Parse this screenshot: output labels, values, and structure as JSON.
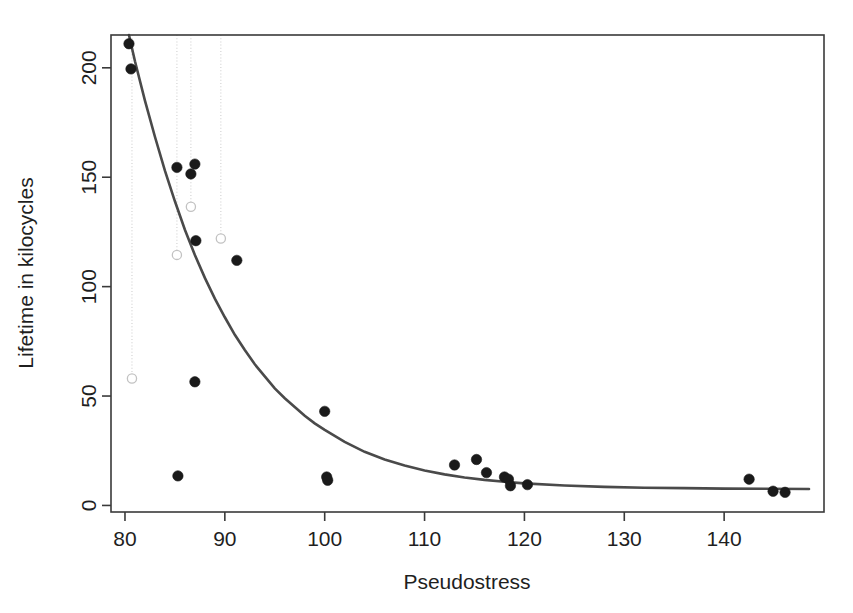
{
  "figure": {
    "background": "#ffffff",
    "foreground": "#1a1a1a",
    "curve_color": "#4a4a4a",
    "dropline_color": "#cfcfcf",
    "open_point_color": "#c2c2c2"
  },
  "axis_titles": {
    "x": "Pseudostress",
    "y": "Lifetime in kilocycles"
  },
  "chart_data": {
    "type": "scatter",
    "title": "",
    "xlabel": "Pseudostress",
    "ylabel": "Lifetime in kilocycles",
    "xlim": [
      78.6,
      150.0
    ],
    "ylim": [
      -3.0,
      215.0
    ],
    "xticks": [
      80,
      90,
      100,
      110,
      120,
      130,
      140
    ],
    "yticks": [
      0,
      50,
      100,
      150,
      200
    ],
    "xticklabels": [
      "80",
      "90",
      "100",
      "110",
      "120",
      "130",
      "140"
    ],
    "yticklabels": [
      "0",
      "50",
      "100",
      "150",
      "200"
    ],
    "grid": false,
    "legend": null,
    "series": [
      {
        "name": "observed",
        "marker": "filled-circle",
        "color": "#1a1a1a",
        "points": [
          {
            "x": 80.4,
            "y": 211.0
          },
          {
            "x": 80.6,
            "y": 199.5
          },
          {
            "x": 85.2,
            "y": 154.5
          },
          {
            "x": 86.6,
            "y": 151.5
          },
          {
            "x": 87.0,
            "y": 156.0
          },
          {
            "x": 87.1,
            "y": 121.0
          },
          {
            "x": 87.0,
            "y": 56.5
          },
          {
            "x": 85.3,
            "y": 13.5
          },
          {
            "x": 91.2,
            "y": 112.0
          },
          {
            "x": 100.0,
            "y": 43.0
          },
          {
            "x": 100.2,
            "y": 13.0
          },
          {
            "x": 100.3,
            "y": 11.5
          },
          {
            "x": 113.0,
            "y": 18.5
          },
          {
            "x": 115.2,
            "y": 21.0
          },
          {
            "x": 116.2,
            "y": 15.0
          },
          {
            "x": 118.0,
            "y": 13.0
          },
          {
            "x": 118.4,
            "y": 12.0
          },
          {
            "x": 118.6,
            "y": 9.0
          },
          {
            "x": 120.3,
            "y": 9.5
          },
          {
            "x": 142.5,
            "y": 12.0
          },
          {
            "x": 144.9,
            "y": 6.5
          },
          {
            "x": 146.1,
            "y": 6.0
          }
        ]
      },
      {
        "name": "censored-or-predicted",
        "marker": "open-circle",
        "color": "#c2c2c2",
        "points": [
          {
            "x": 80.7,
            "y": 58.0
          },
          {
            "x": 85.2,
            "y": 114.5
          },
          {
            "x": 86.6,
            "y": 136.5
          },
          {
            "x": 89.6,
            "y": 122.0
          }
        ]
      }
    ],
    "drop_lines": [
      {
        "x": 80.7,
        "y_top": 215.0,
        "y_bottom": 58.0
      },
      {
        "x": 85.2,
        "y_top": 215.0,
        "y_bottom": 114.5
      },
      {
        "x": 86.6,
        "y_top": 215.0,
        "y_bottom": 136.5
      },
      {
        "x": 89.6,
        "y_top": 215.0,
        "y_bottom": 122.0
      }
    ],
    "fit_curve": {
      "name": "fitted-model",
      "color": "#4a4a4a",
      "points": [
        {
          "x": 80.4,
          "y": 215.0
        },
        {
          "x": 81.0,
          "y": 203.0
        },
        {
          "x": 82.0,
          "y": 185.0
        },
        {
          "x": 83.0,
          "y": 168.5
        },
        {
          "x": 84.0,
          "y": 153.0
        },
        {
          "x": 85.0,
          "y": 139.0
        },
        {
          "x": 86.0,
          "y": 126.0
        },
        {
          "x": 87.0,
          "y": 114.5
        },
        {
          "x": 88.0,
          "y": 104.0
        },
        {
          "x": 89.0,
          "y": 94.5
        },
        {
          "x": 90.0,
          "y": 86.0
        },
        {
          "x": 91.0,
          "y": 78.0
        },
        {
          "x": 92.0,
          "y": 71.0
        },
        {
          "x": 93.0,
          "y": 64.5
        },
        {
          "x": 94.0,
          "y": 59.0
        },
        {
          "x": 95.0,
          "y": 53.5
        },
        {
          "x": 96.0,
          "y": 49.0
        },
        {
          "x": 97.0,
          "y": 45.0
        },
        {
          "x": 98.0,
          "y": 41.0
        },
        {
          "x": 99.0,
          "y": 37.5
        },
        {
          "x": 100.0,
          "y": 34.5
        },
        {
          "x": 102.0,
          "y": 29.0
        },
        {
          "x": 104.0,
          "y": 24.5
        },
        {
          "x": 106.0,
          "y": 21.0
        },
        {
          "x": 108.0,
          "y": 18.2
        },
        {
          "x": 110.0,
          "y": 16.0
        },
        {
          "x": 112.0,
          "y": 14.2
        },
        {
          "x": 114.0,
          "y": 12.8
        },
        {
          "x": 116.0,
          "y": 11.7
        },
        {
          "x": 118.0,
          "y": 10.8
        },
        {
          "x": 120.0,
          "y": 10.1
        },
        {
          "x": 124.0,
          "y": 9.1
        },
        {
          "x": 128.0,
          "y": 8.5
        },
        {
          "x": 132.0,
          "y": 8.1
        },
        {
          "x": 136.0,
          "y": 7.9
        },
        {
          "x": 140.0,
          "y": 7.7
        },
        {
          "x": 144.0,
          "y": 7.6
        },
        {
          "x": 148.5,
          "y": 7.5
        }
      ]
    }
  }
}
